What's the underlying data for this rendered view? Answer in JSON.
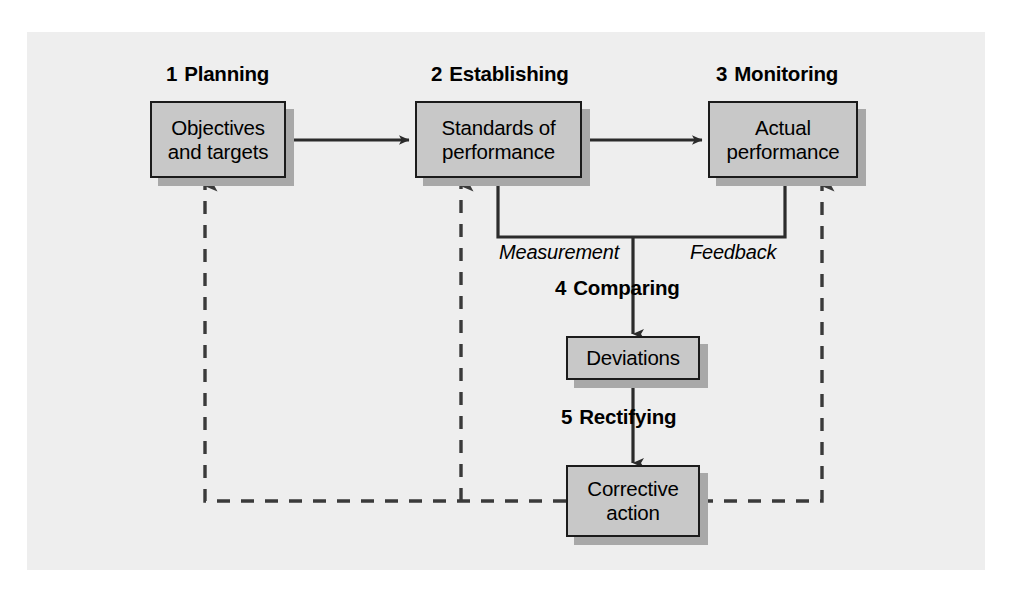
{
  "diagram": {
    "background_color": "#eeeeee",
    "box_fill": "#c8c8c8",
    "box_border": "#1b1b1b",
    "shadow_color": "#a8a8a8",
    "stages": [
      {
        "number": "1",
        "name": "Planning",
        "box_text": "Objectives\nand targets",
        "line1": "Objectives",
        "line2": "and targets"
      },
      {
        "number": "2",
        "name": "Establishing",
        "box_text": "Standards of\nperformance",
        "line1": "Standards of",
        "line2": "performance"
      },
      {
        "number": "3",
        "name": "Monitoring",
        "box_text": "Actual\nperformance",
        "line1": "Actual",
        "line2": "performance"
      },
      {
        "number": "4",
        "name": "Comparing",
        "box_text": "Deviations",
        "line1": "Deviations",
        "line2": ""
      },
      {
        "number": "5",
        "name": "Rectifying",
        "box_text": "Corrective\naction",
        "line1": "Corrective",
        "line2": "action"
      }
    ],
    "flow_labels": [
      {
        "id": "measurement",
        "text": "Measurement"
      },
      {
        "id": "feedback",
        "text": "Feedback"
      }
    ]
  }
}
